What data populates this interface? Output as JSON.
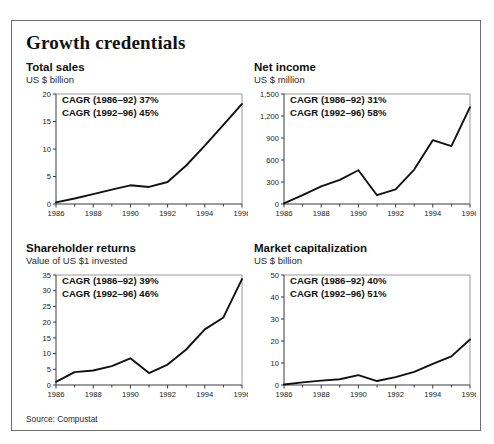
{
  "exhibit": {
    "title": "Growth credentials",
    "source": "Source: Compustat"
  },
  "chart_data": [
    {
      "id": "total-sales",
      "type": "line",
      "title": "Total sales",
      "subtitle": "US $ billion",
      "ylabel": "US $ billion",
      "xlabel": "",
      "x": [
        1986,
        1987,
        1988,
        1989,
        1990,
        1991,
        1992,
        1993,
        1994,
        1995,
        1996
      ],
      "values": [
        0.3,
        1.0,
        1.8,
        2.6,
        3.4,
        3.1,
        4.0,
        7.0,
        10.6,
        14.4,
        18.2
      ],
      "ylim": [
        0,
        20
      ],
      "yticks": [
        0,
        5,
        10,
        15,
        20
      ],
      "yticklabels": [
        "0",
        "5",
        "10",
        "15",
        "20"
      ],
      "xlim": [
        1986,
        1996
      ],
      "xticks": [
        1986,
        1988,
        1990,
        1992,
        1994,
        1996
      ],
      "xticklabels": [
        "1986",
        "1988",
        "1990",
        "1992",
        "1994",
        "1996"
      ],
      "grid": false,
      "annotations": [
        "CAGR (1986–92) 37%",
        "CAGR (1992–96) 45%"
      ]
    },
    {
      "id": "net-income",
      "type": "line",
      "title": "Net income",
      "subtitle": "US $ million",
      "ylabel": "US $ million",
      "xlabel": "",
      "x": [
        1986,
        1987,
        1988,
        1989,
        1990,
        1991,
        1992,
        1993,
        1994,
        1995,
        1996
      ],
      "values": [
        10,
        120,
        240,
        330,
        460,
        120,
        200,
        470,
        870,
        790,
        1320
      ],
      "ylim": [
        0,
        1500
      ],
      "yticks": [
        0,
        300,
        600,
        900,
        1200,
        1500
      ],
      "yticklabels": [
        "0",
        "300",
        "600",
        "900",
        "1,200",
        "1,500"
      ],
      "xlim": [
        1986,
        1996
      ],
      "xticks": [
        1986,
        1988,
        1990,
        1992,
        1994,
        1996
      ],
      "xticklabels": [
        "1986",
        "1988",
        "1990",
        "1992",
        "1994",
        "1996"
      ],
      "grid": false,
      "annotations": [
        "CAGR (1986–92) 31%",
        "CAGR (1992–96) 58%"
      ]
    },
    {
      "id": "shareholder-returns",
      "type": "line",
      "title": "Shareholder returns",
      "subtitle": "Value of US $1 invested",
      "ylabel": "Value of US $1 invested",
      "xlabel": "",
      "x": [
        1986,
        1987,
        1988,
        1989,
        1990,
        1991,
        1992,
        1993,
        1994,
        1995,
        1996
      ],
      "values": [
        1.0,
        4.1,
        4.6,
        6.0,
        8.5,
        3.8,
        6.5,
        11.3,
        17.7,
        21.5,
        33.7
      ],
      "ylim": [
        0,
        35
      ],
      "yticks": [
        0,
        5,
        10,
        15,
        20,
        25,
        30,
        35
      ],
      "yticklabels": [
        "0",
        "5",
        "10",
        "15",
        "20",
        "25",
        "30",
        "35"
      ],
      "xlim": [
        1986,
        1996
      ],
      "xticks": [
        1986,
        1988,
        1990,
        1992,
        1994,
        1996
      ],
      "xticklabels": [
        "1986",
        "1988",
        "1990",
        "1992",
        "1994",
        "1996"
      ],
      "grid": false,
      "annotations": [
        "CAGR (1986–92) 39%",
        "CAGR (1992–96) 46%"
      ]
    },
    {
      "id": "market-capitalization",
      "type": "line",
      "title": "Market capitalization",
      "subtitle": "US $ billion",
      "ylabel": "US $ billion",
      "xlabel": "",
      "x": [
        1986,
        1987,
        1988,
        1989,
        1990,
        1991,
        1992,
        1993,
        1994,
        1995,
        1996
      ],
      "values": [
        0.2,
        1.2,
        2.0,
        2.6,
        4.5,
        1.8,
        3.6,
        6.0,
        9.6,
        13.0,
        20.7
      ],
      "ylim": [
        0,
        50
      ],
      "yticks": [
        0,
        10,
        20,
        30,
        40,
        50
      ],
      "yticklabels": [
        "0",
        "10",
        "20",
        "30",
        "40",
        "50"
      ],
      "xlim": [
        1986,
        1996
      ],
      "xticks": [
        1986,
        1988,
        1990,
        1992,
        1994,
        1996
      ],
      "xticklabels": [
        "1986",
        "1988",
        "1990",
        "1992",
        "1994",
        "1996"
      ],
      "grid": false,
      "annotations": [
        "CAGR (1986–92) 40%",
        "CAGR (1992–96) 51%"
      ]
    }
  ]
}
